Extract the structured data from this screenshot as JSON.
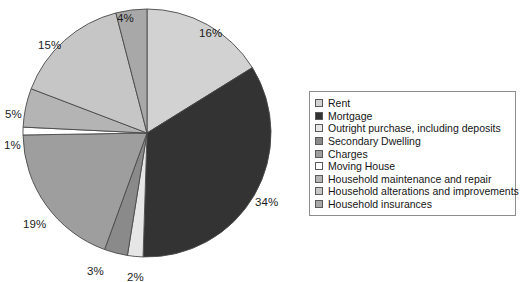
{
  "chart_data": {
    "type": "pie",
    "title": "",
    "xlabel": "",
    "ylabel": "",
    "legend_position": "right",
    "grid": false,
    "labels_suffix": "%",
    "start_angle_deg": 0,
    "direction": "clockwise",
    "categories": [
      "Rent",
      "Mortgage",
      "Outright purchase, including deposits",
      "Secondary Dwelling",
      "Charges",
      "Moving House",
      "Household maintenance and repair",
      "Household alterations and improvements",
      "Household insurances"
    ],
    "values": [
      16,
      34,
      2,
      3,
      19,
      1,
      5,
      15,
      4
    ],
    "value_labels": [
      "16%",
      "34%",
      "2%",
      "3%",
      "19%",
      "1%",
      "5%",
      "15%",
      "4%"
    ],
    "colors": [
      "#d2d2d2",
      "#333333",
      "#e6e6e6",
      "#8a8a8a",
      "#9e9e9e",
      "#ffffff",
      "#b4b4b4",
      "#c6c6c6",
      "#a8a8a8"
    ],
    "slice_border_color": "#4a4a4a"
  },
  "legend": {
    "entries": [
      {
        "label": "Rent",
        "color": "#d2d2d2"
      },
      {
        "label": "Mortgage",
        "color": "#333333"
      },
      {
        "label": "Outright purchase, including deposits",
        "color": "#e6e6e6"
      },
      {
        "label": "Secondary Dwelling",
        "color": "#8a8a8a"
      },
      {
        "label": "Charges",
        "color": "#9e9e9e"
      },
      {
        "label": "Moving House",
        "color": "#ffffff"
      },
      {
        "label": "Household maintenance and repair",
        "color": "#b4b4b4"
      },
      {
        "label": "Household alterations and improvements",
        "color": "#c6c6c6"
      },
      {
        "label": "Household insurances",
        "color": "#a8a8a8"
      }
    ]
  },
  "pie_labels": [
    {
      "text": "16%",
      "left": 199,
      "top": 27
    },
    {
      "text": "34%",
      "left": 255,
      "top": 196
    },
    {
      "text": "2%",
      "left": 127,
      "top": 271
    },
    {
      "text": "3%",
      "left": 87,
      "top": 265
    },
    {
      "text": "19%",
      "left": 23,
      "top": 218
    },
    {
      "text": "1%",
      "left": 4,
      "top": 139
    },
    {
      "text": "5%",
      "left": 5,
      "top": 108
    },
    {
      "text": "15%",
      "left": 38,
      "top": 39
    },
    {
      "text": "4%",
      "left": 117,
      "top": 12
    }
  ]
}
